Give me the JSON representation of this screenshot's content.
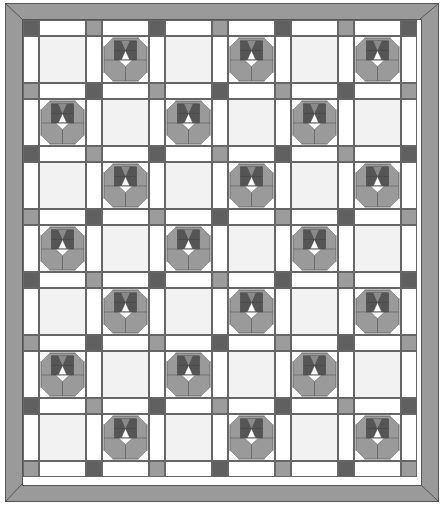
{
  "quilt": {
    "title": "Sashed quilt with alternating flower blocks",
    "columns": 6,
    "rows": 7,
    "block_size_px": 47,
    "sash_width_px": 16,
    "colors": {
      "border": "#9a9a9a",
      "outline": "#555555",
      "sashing": "#ffffff",
      "cornerstone_dark": "#606060",
      "cornerstone_light": "#9c9c9c",
      "plain_block": "#f2f2f2",
      "petal": "#9a9a9a",
      "center_dark": "#555555",
      "center_mid": "#7a7a7a"
    },
    "layout_note": "Flower blocks alternate with plain blocks in a checkerboard; row 0 starts plain at column 0"
  }
}
